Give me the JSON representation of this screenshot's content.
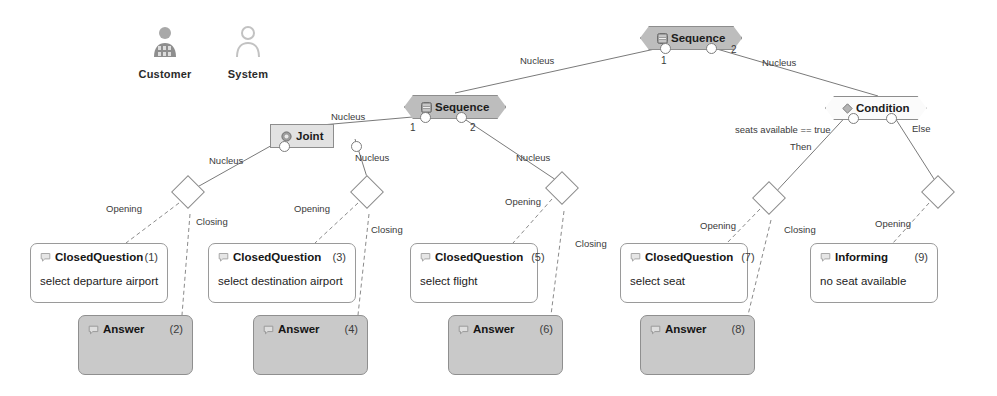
{
  "diagram": {
    "colors": {
      "node_dark_fill": "#bdbdbd",
      "node_light_fill": "#fbfbfb",
      "joint_fill": "#e2e2e2",
      "answer_fill": "#c9c9c9",
      "question_fill": "#ffffff",
      "stroke": "#8d8d8d",
      "text": "#1c1c1c"
    }
  },
  "legend": {
    "items": [
      {
        "label": "Customer",
        "icon": "person-filled-icon",
        "style": "filled"
      },
      {
        "label": "System",
        "icon": "person-outline-icon",
        "style": "outline"
      }
    ]
  },
  "structure_nodes": [
    {
      "id": "seq-top",
      "type": "Sequence",
      "icon": "sequence-icon",
      "style": "dark",
      "ports": [
        "1",
        "2"
      ]
    },
    {
      "id": "seq-mid",
      "type": "Sequence",
      "icon": "sequence-icon",
      "style": "dark",
      "ports": [
        "1",
        "2"
      ]
    },
    {
      "id": "joint",
      "type": "Joint",
      "icon": "joint-icon",
      "style": "rect",
      "ports": [
        "",
        ""
      ]
    },
    {
      "id": "condition",
      "type": "Condition",
      "icon": "condition-icon",
      "style": "light",
      "ports": [
        "",
        ""
      ]
    }
  ],
  "content_nodes": [
    {
      "id": "cq1",
      "type": "ClosedQuestion",
      "icon": "closed-question-icon",
      "number": "(1)",
      "text": "select departure airport",
      "role": "question"
    },
    {
      "id": "an2",
      "type": "Answer",
      "icon": "answer-icon",
      "number": "(2)",
      "text": "",
      "role": "answer"
    },
    {
      "id": "cq3",
      "type": "ClosedQuestion",
      "icon": "closed-question-icon",
      "number": "(3)",
      "text": "select destination airport",
      "role": "question"
    },
    {
      "id": "an4",
      "type": "Answer",
      "icon": "answer-icon",
      "number": "(4)",
      "text": "",
      "role": "answer"
    },
    {
      "id": "cq5",
      "type": "ClosedQuestion",
      "icon": "closed-question-icon",
      "number": "(5)",
      "text": "select flight",
      "role": "question"
    },
    {
      "id": "an6",
      "type": "Answer",
      "icon": "answer-icon",
      "number": "(6)",
      "text": "",
      "role": "answer"
    },
    {
      "id": "cq7",
      "type": "ClosedQuestion",
      "icon": "closed-question-icon",
      "number": "(7)",
      "text": "select seat",
      "role": "question"
    },
    {
      "id": "an8",
      "type": "Answer",
      "icon": "answer-icon",
      "number": "(8)",
      "text": "",
      "role": "answer"
    },
    {
      "id": "inf9",
      "type": "Informing",
      "icon": "informing-icon",
      "number": "(9)",
      "text": "no seat available",
      "role": "question"
    }
  ],
  "edge_labels": {
    "nucleus_top_left": "Nucleus",
    "nucleus_top_right": "Nucleus",
    "nucleus_mid_left": "Nucleus",
    "nucleus_mid_right": "Nucleus",
    "nucleus_joint_left": "Nucleus",
    "nucleus_joint_right": "Nucleus",
    "opening_1": "Opening",
    "closing_1": "Closing",
    "opening_2": "Opening",
    "closing_2": "Closing",
    "opening_3": "Opening",
    "closing_3": "Closing",
    "opening_4": "Opening",
    "closing_4": "Closing",
    "opening_5": "Opening",
    "condition_guard": "seats available == true",
    "condition_then": "Then",
    "condition_else": "Else"
  },
  "port_indices": {
    "top_seq_1": "1",
    "top_seq_2": "2",
    "mid_seq_1": "1",
    "mid_seq_2": "2"
  }
}
